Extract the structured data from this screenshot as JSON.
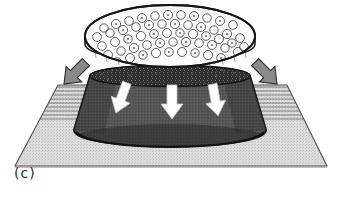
{
  "figure": {
    "panel_label": "(c)",
    "caption_text": "(c)",
    "background_color": "#ffffff",
    "width": 343,
    "height": 198
  },
  "substrate": {
    "name": "substrate-plane",
    "fill_color": "#d2d2d2",
    "outline_color": "#4a4a4a",
    "hatch_color": "#6e6e6e",
    "corners": {
      "back_left": [
        58,
        85
      ],
      "back_right": [
        287,
        85
      ],
      "front_right": [
        327,
        166
      ],
      "front_left": [
        15,
        166
      ]
    },
    "hatch_line_count": 9,
    "hatch_note": "horizontal compression lines along the rear band of the plane on both sides of the dome"
  },
  "dome": {
    "name": "dome-body",
    "fill_color": "#555555",
    "shade_color": "#3f3f3f",
    "outline_color": "#1c1c1c",
    "top_rim_color": "#2e2e2e",
    "top_center": [
      170,
      76
    ],
    "top_radius_x": 80,
    "top_radius_y": 14,
    "base_center": [
      170,
      134
    ],
    "base_radius_x": 96,
    "base_radius_y": 17,
    "height": 58
  },
  "disc": {
    "name": "cellular-disc",
    "fill_color": "#f7f7f7",
    "outline_color": "#1c1c1c",
    "rim_color": "#9a9a9a",
    "center": [
      170,
      38
    ],
    "radius_x": 85,
    "radius_y": 33,
    "thickness": 12,
    "texture": "packed small rings / cell cross-sections",
    "cell_count": 96
  },
  "arrows": {
    "side": {
      "name": "side-compression-arrows",
      "fill_color": "#8a8a8a",
      "outline_color": "#2b2b2b",
      "count": 2,
      "items": [
        {
          "name": "arrow-left-inward",
          "direction": "down-right",
          "tip": [
            92,
            86
          ],
          "angle_deg": 45
        },
        {
          "name": "arrow-right-inward",
          "direction": "down-left",
          "tip": [
            249,
            86
          ],
          "angle_deg": -45
        }
      ]
    },
    "downward": {
      "name": "downward-pressure-arrows",
      "fill_color": "#ffffff",
      "outline_color": "#bdbdbd",
      "count": 3,
      "items": [
        {
          "name": "arrow-down-left",
          "x": 122,
          "y": 96,
          "angle_deg": 20
        },
        {
          "name": "arrow-down-center",
          "x": 172,
          "y": 100,
          "angle_deg": 0
        },
        {
          "name": "arrow-down-right",
          "x": 215,
          "y": 98,
          "angle_deg": -10
        }
      ]
    }
  }
}
